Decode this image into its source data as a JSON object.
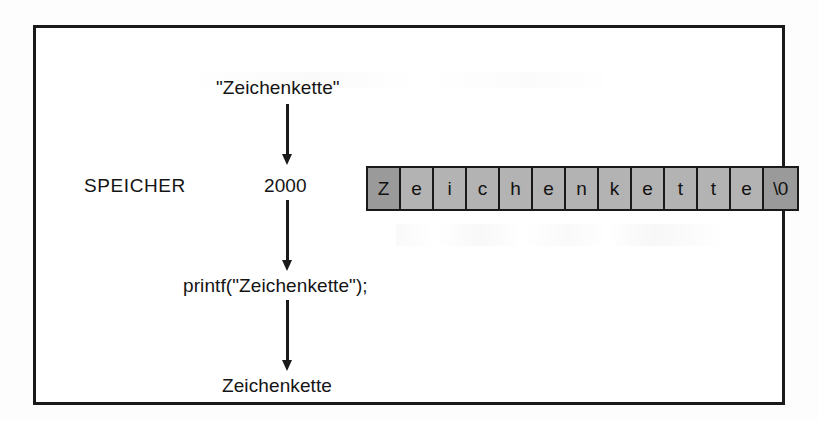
{
  "diagram": {
    "title": "SPEICHER",
    "top_literal": "\"Zeichenkette\"",
    "memory_label": "SPEICHER",
    "address": "2000",
    "printf_call": "printf(\"Zeichenkette\");",
    "output_text": "Zeichenkette"
  },
  "memory": {
    "cells": [
      {
        "char": "Z",
        "shaded": true
      },
      {
        "char": "e",
        "shaded": false
      },
      {
        "char": "i",
        "shaded": false
      },
      {
        "char": "c",
        "shaded": false
      },
      {
        "char": "h",
        "shaded": false
      },
      {
        "char": "e",
        "shaded": false
      },
      {
        "char": "n",
        "shaded": false
      },
      {
        "char": "k",
        "shaded": false
      },
      {
        "char": "e",
        "shaded": false
      },
      {
        "char": "t",
        "shaded": false
      },
      {
        "char": "t",
        "shaded": false
      },
      {
        "char": "e",
        "shaded": false
      },
      {
        "char": "\\0",
        "shaded": true
      }
    ]
  },
  "flow": {
    "arrows": [
      {
        "name": "arrow-literal-to-address"
      },
      {
        "name": "arrow-address-to-printf"
      },
      {
        "name": "arrow-printf-to-output"
      }
    ]
  },
  "colors": {
    "ink": "#1a1a1a",
    "cell_fill": "#b3b3b3",
    "cell_fill_shaded": "#9a9a9a",
    "paper": "#ffffff"
  }
}
